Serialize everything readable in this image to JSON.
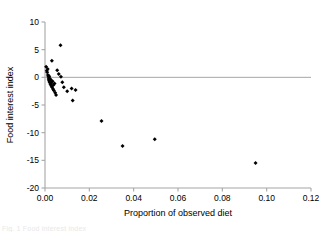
{
  "chart_data": {
    "type": "scatter",
    "title": "",
    "xlabel": "Proportion of observed diet",
    "ylabel": "Food interest index",
    "xlim": [
      0,
      0.12
    ],
    "ylim": [
      -20,
      10
    ],
    "xticks": [
      "0.00",
      "0.02",
      "0.04",
      "0.06",
      "0.08",
      "0.10",
      "0.12"
    ],
    "xtick_values": [
      0,
      0.02,
      0.04,
      0.06,
      0.08,
      0.1,
      0.12
    ],
    "yticks": [
      "10",
      "5",
      "0",
      "-5",
      "-10",
      "-15",
      "-20"
    ],
    "ytick_values": [
      10,
      5,
      0,
      -5,
      -10,
      -15,
      -20
    ],
    "grid": false,
    "legend": "none",
    "zero_line": 0,
    "marker": "filled-diamond",
    "marker_color": "#000000",
    "axis_color": "#a6a6a6",
    "points": [
      [
        0.0005,
        1.9
      ],
      [
        0.0008,
        1.2
      ],
      [
        0.001,
        0.9
      ],
      [
        0.0012,
        1.5
      ],
      [
        0.0013,
        0.4
      ],
      [
        0.0015,
        0.1
      ],
      [
        0.0016,
        -0.3
      ],
      [
        0.0018,
        -0.6
      ],
      [
        0.0019,
        0.2
      ],
      [
        0.0021,
        -0.9
      ],
      [
        0.0022,
        -0.2
      ],
      [
        0.0024,
        -1.2
      ],
      [
        0.0026,
        -0.5
      ],
      [
        0.0028,
        -1.5
      ],
      [
        0.003,
        -1.0
      ],
      [
        0.0032,
        -1.8
      ],
      [
        0.0034,
        -0.7
      ],
      [
        0.0036,
        -2.1
      ],
      [
        0.0038,
        -1.4
      ],
      [
        0.004,
        -2.4
      ],
      [
        0.0043,
        -1.1
      ],
      [
        0.0046,
        -2.8
      ],
      [
        0.005,
        -3.2
      ],
      [
        0.0031,
        3.0
      ],
      [
        0.007,
        5.8
      ],
      [
        0.0055,
        1.3
      ],
      [
        0.0062,
        0.6
      ],
      [
        0.0072,
        0.1
      ],
      [
        0.0078,
        -0.9
      ],
      [
        0.0085,
        -1.8
      ],
      [
        0.01,
        -2.5
      ],
      [
        0.012,
        -2.0
      ],
      [
        0.0138,
        -2.3
      ],
      [
        0.0125,
        -4.2
      ],
      [
        0.0255,
        -7.9
      ],
      [
        0.035,
        -12.4
      ],
      [
        0.0495,
        -11.2
      ],
      [
        0.095,
        -15.5
      ]
    ]
  },
  "caption": {
    "text": "Fig. 1  Food interest index"
  }
}
